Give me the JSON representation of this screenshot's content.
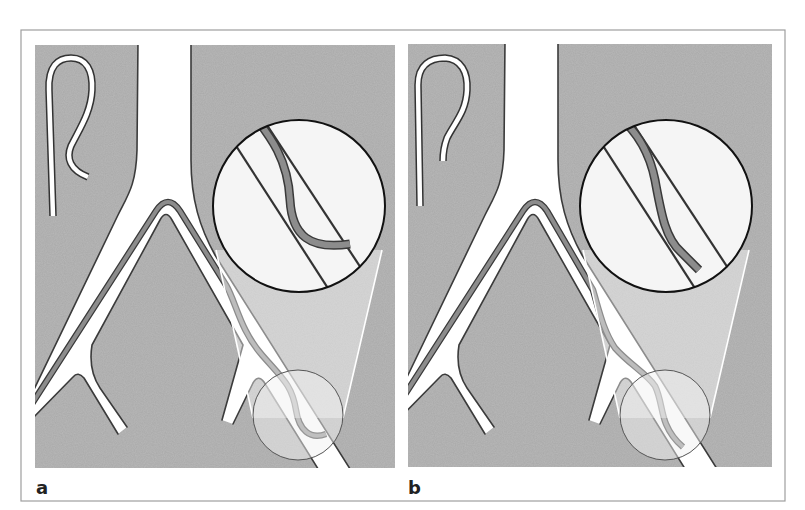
{
  "figure": {
    "panels": [
      {
        "id": "a",
        "label": "a",
        "content": "Hooked catheter advanced through branching airway; magnified view shows catheter tip curling across the lumen"
      },
      {
        "id": "b",
        "label": "b",
        "content": "Hooked catheter advanced through branching airway; magnified view shows catheter tip aligned along the lumen"
      }
    ]
  },
  "colors": {
    "background_panel": "#a9a9a9",
    "airway": "#ffffff",
    "airway_wall": "#3b3b3b",
    "catheter": "#8c8c8c",
    "magnifier": "#f5f5f5",
    "frame": "#9e9e9e",
    "label": "#222222"
  }
}
